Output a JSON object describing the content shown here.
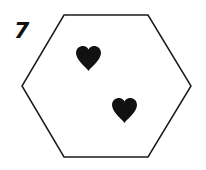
{
  "puzzle": {
    "number": "7",
    "shape": "hexagon",
    "symbol": "heart-icon",
    "symbol_count": 2,
    "colors": {
      "stroke": "#1a1a1a",
      "fill": "#111111",
      "background": "#ffffff"
    }
  }
}
